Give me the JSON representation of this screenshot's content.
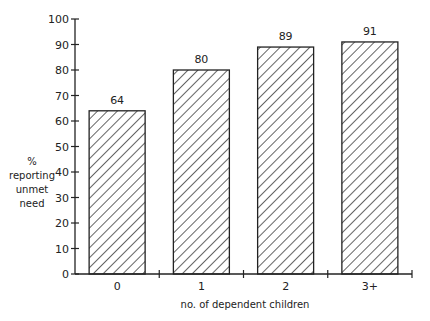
{
  "chart_data": {
    "type": "bar",
    "title": "",
    "xlabel": "no. of dependent children",
    "ylabel": [
      "%",
      "reporting",
      "unmet",
      "need"
    ],
    "categories": [
      "0",
      "1",
      "2",
      "3+"
    ],
    "values": [
      64,
      80,
      89,
      91
    ],
    "data_labels": [
      "64",
      "80",
      "89",
      "91"
    ],
    "ylim": [
      0,
      100
    ],
    "yticks": [
      "0",
      "10",
      "20",
      "30",
      "40",
      "50",
      "60",
      "70",
      "80",
      "90",
      "100"
    ],
    "grid": false,
    "fill_pattern": "diagonal-hatch",
    "colors": {
      "stroke": "#222222",
      "background": "#ffffff"
    }
  }
}
